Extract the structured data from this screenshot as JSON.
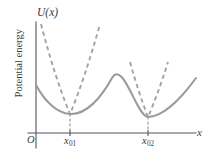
{
  "figure": {
    "axes": {
      "y_axis_label": "U(x)",
      "x_axis_label": "x",
      "y_title": "Potential energy",
      "origin_label": "O"
    },
    "tick_labels": [
      {
        "base": "x",
        "sub": "01"
      },
      {
        "base": "x",
        "sub": "02"
      }
    ],
    "colors": {
      "curve": "#9b9b9e",
      "parabola": "#a2a2a6",
      "axis": "#55555a",
      "text": "#3a3a3e",
      "background": "#ffffff"
    }
  },
  "chart_data": {
    "type": "line",
    "title": "",
    "xlabel": "x",
    "ylabel": "Potential energy",
    "grid": false,
    "legend": false,
    "axis_origin_label": "O",
    "xticks": [
      "x01",
      "x02"
    ],
    "xtick_positions": [
      70,
      148
    ],
    "series": [
      {
        "name": "potential-energy-curve",
        "style": "solid",
        "color": "#9b9b9e",
        "path": "M 36 85 C 44 100, 56 113, 70 114 C 86 115, 101 98, 112 78 C 123 59, 137 117, 148 117 C 162 117, 180 100, 196 78",
        "features": {
          "left_endpoint": [
            36,
            85
          ],
          "minimum_1": [
            70,
            114
          ],
          "local_maximum": [
            112,
            78
          ],
          "minimum_2": [
            148,
            117
          ],
          "right_endpoint": [
            196,
            78
          ]
        }
      },
      {
        "name": "harmonic-approximation-well-1",
        "style": "dashed",
        "color": "#a2a2a6",
        "path": "M 41 24 Q 55 78, 70 114 Q 85 78, 100 24",
        "vertex": [
          70,
          114
        ],
        "description": "steep narrow parabola approximating first minimum"
      },
      {
        "name": "harmonic-approximation-well-2",
        "style": "dashed",
        "color": "#a2a2a6",
        "path": "M 130 62 Q 139 94, 148 117 Q 158 94, 168 62",
        "vertex": [
          148,
          117
        ],
        "description": "wider shallower parabola approximating second minimum"
      }
    ],
    "annotations": [
      {
        "name": "drop-line-x01",
        "from": [
          70,
          114
        ],
        "to": [
          70,
          133
        ],
        "style": "dashed"
      },
      {
        "name": "drop-line-x02",
        "from": [
          148,
          117
        ],
        "to": [
          148,
          133
        ],
        "style": "dashed"
      }
    ],
    "axis_ranges": {
      "x_axis_y": 133,
      "y_axis_x": 36,
      "x_from": 28,
      "x_to": 196,
      "y_from": 22,
      "y_to": 148
    }
  }
}
